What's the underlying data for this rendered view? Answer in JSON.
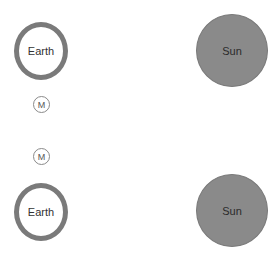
{
  "diagram": {
    "panels": [
      {
        "earth": {
          "label": "Earth"
        },
        "moon": {
          "label": "M"
        },
        "sun": {
          "label": "Sun"
        }
      },
      {
        "earth": {
          "label": "Earth"
        },
        "moon": {
          "label": "M"
        },
        "sun": {
          "label": "Sun"
        }
      }
    ],
    "colors": {
      "earth_ring": "#7a7a7a",
      "sun_fill": "#8a8a8a",
      "moon_outline": "#8a8a8a",
      "background": "#ffffff"
    }
  }
}
